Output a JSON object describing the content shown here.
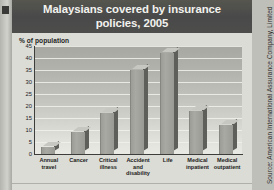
{
  "title": "Malaysians covered by insurance policies, 2005",
  "axis_title": "% of population",
  "source": "Source: American International Assurance Company, Limited",
  "colors": {
    "titlebar": "#4e4e4c",
    "title_text": "#f2f2ee",
    "card": "#dcdcd7",
    "bar_front": "#a9a9a4",
    "bar_side": "#5e5e5b",
    "bar_top": "#c7c7c2",
    "gridline": "#f1f1ec",
    "axis": "#3d3d3b"
  },
  "chart_data": {
    "type": "bar",
    "title": "Malaysians covered by insurance policies, 2005",
    "subtitle": "",
    "xlabel": "",
    "ylabel": "% of population",
    "ylim": [
      0,
      45
    ],
    "yticks": [
      0,
      5,
      10,
      15,
      20,
      25,
      30,
      35,
      40,
      45
    ],
    "ytick_labels": [
      "0",
      "5",
      "10",
      "15",
      "20",
      "25",
      "30",
      "35",
      "40",
      "45"
    ],
    "grid": true,
    "legend": false,
    "categories": [
      "Annual travel",
      "Cancer",
      "Critical illness",
      "Accident and disability",
      "Life",
      "Medical inpatient",
      "Medical outpatient"
    ],
    "category_lines": [
      [
        "Annual",
        "travel"
      ],
      [
        "Cancer"
      ],
      [
        "Critical",
        "illness"
      ],
      [
        "Accident",
        "and",
        "disability"
      ],
      [
        "Life"
      ],
      [
        "Medical",
        "inpatient"
      ],
      [
        "Medical",
        "outpatient"
      ]
    ],
    "values": [
      3,
      9,
      17,
      35,
      42,
      18,
      12
    ],
    "annotations": [
      "Source: American International Assurance Company, Limited"
    ]
  }
}
